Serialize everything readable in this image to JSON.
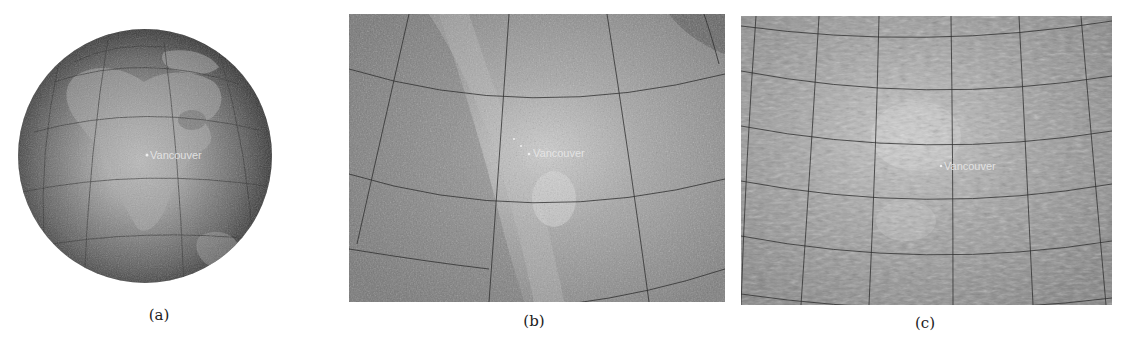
{
  "figure": {
    "panels": [
      {
        "id": "a",
        "caption": "(a)",
        "view": "globe",
        "city_label": "Vancouver",
        "description": "Orthographic globe view centered over North America"
      },
      {
        "id": "b",
        "caption": "(b)",
        "view": "regional-zoom",
        "city_label": "Vancouver",
        "description": "Zoomed regional view with graticule"
      },
      {
        "id": "c",
        "caption": "(c)",
        "view": "close-zoom",
        "city_label": "Vancouver",
        "description": "Closer zoomed view with fine-detail terrain and graticule"
      }
    ],
    "colors": {
      "background": "#ffffff",
      "globe_edge": "#2a2a2a",
      "globe_center": "#cfcfcf",
      "map_base": "#8a8a8a",
      "map_highlight": "#c8c8c8",
      "graticule": "#2b2b2b",
      "label_text": "#e8e8e8",
      "caption_text": "#222222"
    }
  }
}
